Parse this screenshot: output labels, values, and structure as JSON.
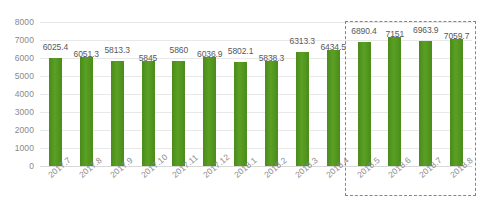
{
  "chart_data": {
    "type": "bar",
    "title": "",
    "xlabel": "",
    "ylabel": "",
    "ylim": [
      0,
      8000
    ],
    "ytick_step": 1000,
    "grid": true,
    "legend": "none",
    "bar_color": "#4e8f1d",
    "highlight_color": "#e4604d",
    "categories": [
      "2017.7",
      "2017.8",
      "2017.9",
      "2017.10",
      "2017.11",
      "2017.12",
      "2018.1",
      "2018.2",
      "2018.3",
      "2018.4",
      "2018.5",
      "2018.6",
      "2018.7",
      "2018.8"
    ],
    "values": [
      6025.4,
      6051.3,
      5813.3,
      5845,
      5860,
      6036.9,
      5802.1,
      5838.3,
      6313.3,
      6434.5,
      6890.4,
      7151,
      6963.9,
      7059.7
    ],
    "value_labels": [
      "6025.4",
      "6051.3",
      "5813.3",
      "5845",
      "5860",
      "6036.9",
      "5802.1",
      "5838.3",
      "6313.3",
      "6434.5",
      "6890.4",
      "7151",
      "6963.9",
      "7059.7"
    ],
    "yticks": [
      "8000",
      "7000",
      "6000",
      "5000",
      "4000",
      "3000",
      "2000",
      "1000",
      "0"
    ],
    "ytick_values": [
      8000,
      7000,
      6000,
      5000,
      4000,
      3000,
      2000,
      1000,
      0
    ],
    "highlight_range": {
      "from_category": "2018.5",
      "to_category": "2018.8",
      "style": "dashed-rectangle"
    },
    "caption": ""
  }
}
